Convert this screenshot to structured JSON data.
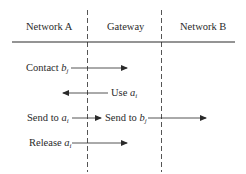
{
  "columns": [
    {
      "label": "Network A"
    },
    {
      "label": "Gateway"
    },
    {
      "label": "Network B"
    }
  ],
  "messages": [
    {
      "text": "Contact",
      "var": "b",
      "sub": "j",
      "direction": "right",
      "from": "Network A",
      "to": "Gateway"
    },
    {
      "text": "Use",
      "var": "a",
      "sub": "i",
      "direction": "left",
      "from": "Gateway",
      "to": "Network A"
    },
    {
      "text": "Send to",
      "var": "a",
      "sub": "i",
      "direction": "right",
      "from": "Network A",
      "to": "Gateway"
    },
    {
      "text": "Send to",
      "var": "b",
      "sub": "j",
      "direction": "right",
      "from": "Gateway",
      "to": "Network B"
    },
    {
      "text": "Release",
      "var": "a",
      "sub": "i",
      "direction": "right",
      "from": "Network A",
      "to": "Gateway"
    }
  ],
  "colors": {
    "ink": "#2a2a2a",
    "background": "#ffffff"
  }
}
